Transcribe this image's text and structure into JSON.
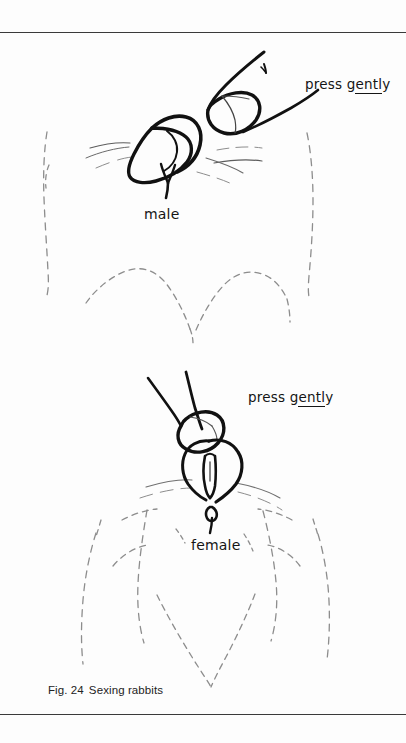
{
  "page": {
    "width": 406,
    "height": 743,
    "background_color": "#fdfdfd",
    "rule_color": "#3a3a3a"
  },
  "figure": {
    "caption_prefix": "Fig. 24",
    "caption_text": "Sexing rabbits",
    "ink_color": "#111111",
    "dashed_color": "#8a8a8a"
  },
  "labels": {
    "press_gently_male": {
      "part_plain_1": "press g",
      "part_underlined": "entl",
      "part_plain_2": "y"
    },
    "press_gently_female": {
      "part_plain_1": "press g",
      "part_underlined": "entl",
      "part_plain_2": "y"
    },
    "male": "male",
    "female": "female"
  }
}
